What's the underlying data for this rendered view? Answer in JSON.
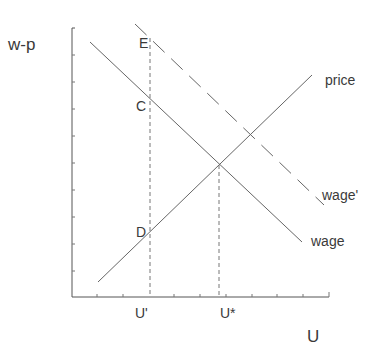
{
  "diagram": {
    "type": "wage-price setting (labor market)",
    "y_axis_label": "w-p",
    "x_axis_label": "U",
    "curves": {
      "price": {
        "label": "price",
        "style": "solid"
      },
      "wage": {
        "label": "wage",
        "style": "solid"
      },
      "wage_shifted": {
        "label": "wage'",
        "style": "dashed"
      }
    },
    "points": {
      "E": "E",
      "C": "C",
      "D": "D"
    },
    "x_markers": {
      "u_prime": "U'",
      "u_star": "U*"
    },
    "colors": {
      "line": "#555555",
      "axis": "#555555",
      "text": "#3a3a3a",
      "background": "#ffffff"
    }
  }
}
